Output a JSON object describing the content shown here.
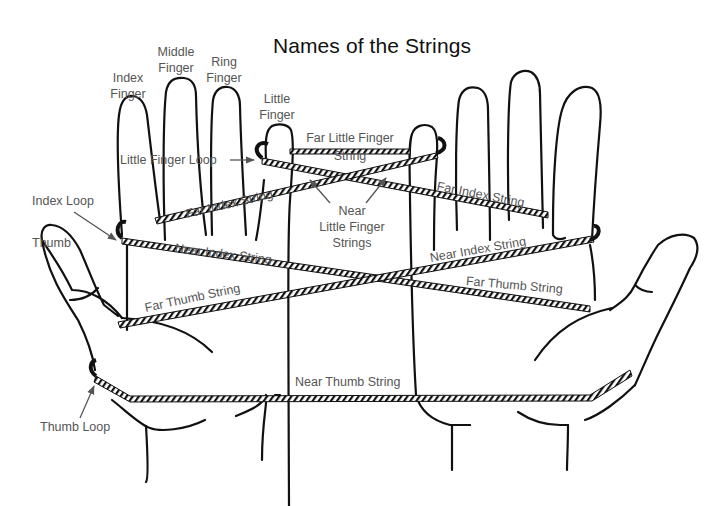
{
  "diagram": {
    "title": "Names of the Strings",
    "hands": [
      "left-hand",
      "right-hand"
    ],
    "finger_labels": {
      "index": [
        "Index",
        "Finger"
      ],
      "middle": [
        "Middle",
        "Finger"
      ],
      "ring": [
        "Ring",
        "Finger"
      ],
      "little": [
        "Little",
        "Finger"
      ],
      "thumb": "Thumb"
    },
    "loop_labels": {
      "little_finger_loop": "Little Finger Loop",
      "index_loop": "Index Loop",
      "thumb_loop": "Thumb Loop"
    },
    "string_labels": {
      "far_little_finger": [
        "Far Little Finger",
        "String"
      ],
      "near_little_finger": [
        "Near",
        "Little Finger",
        "Strings"
      ],
      "far_index_left": "Far Index String",
      "far_index_right": "Far Index String",
      "near_index_left": "Near Index String",
      "near_index_right": "Near Index String",
      "far_thumb_left": "Far Thumb String",
      "far_thumb_right": "Far Thumb String",
      "near_thumb": "Near Thumb String"
    },
    "colors": {
      "outline": "#111111",
      "label_text": "#555555",
      "title_text": "#111111",
      "string_fill": "#ffffff"
    }
  }
}
